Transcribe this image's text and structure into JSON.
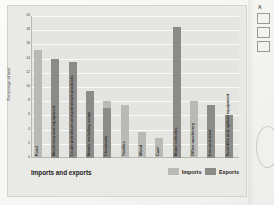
{
  "figure": {
    "title": "Imports and exports",
    "y_axis_label": "Percentage of total",
    "y_ticks": [
      "20",
      "18",
      "16",
      "14",
      "12",
      "10",
      "8",
      "6",
      "4",
      "2",
      "0"
    ],
    "legend": [
      {
        "label": "Imports",
        "color": "#b9b9b5"
      },
      {
        "label": "Exports",
        "color": "#8b8b87"
      }
    ]
  },
  "side_panel": {
    "marker": "A",
    "box_labels": [
      "",
      "",
      ""
    ]
  },
  "chart_data": {
    "type": "bar",
    "title": "Imports and exports",
    "xlabel": "",
    "ylabel": "Percentage of total",
    "ylim": [
      0,
      20
    ],
    "yticks": [
      0,
      2,
      4,
      6,
      8,
      10,
      12,
      14,
      16,
      18,
      20
    ],
    "grid": true,
    "legend_position": "bottom-right",
    "categories": [
      "Food",
      "Machinery and equipment",
      "Crude petroleum and petroleum products",
      "Metals including scrap",
      "Chemicals",
      "Textiles",
      "Wood",
      "Coal",
      "Motor vehicles",
      "Office machinery",
      "Iron and steel",
      "Scientific and optical equipment"
    ],
    "series": [
      {
        "name": "Imports",
        "color": "#b9b9b5",
        "values": [
          15.2,
          null,
          null,
          null,
          8.0,
          7.5,
          3.7,
          2.8,
          null,
          8.0,
          null,
          null
        ]
      },
      {
        "name": "Exports",
        "color": "#8b8b87",
        "values": [
          null,
          14.0,
          13.5,
          9.5,
          7.0,
          null,
          null,
          null,
          18.5,
          null,
          7.5,
          6.0
        ]
      }
    ]
  }
}
